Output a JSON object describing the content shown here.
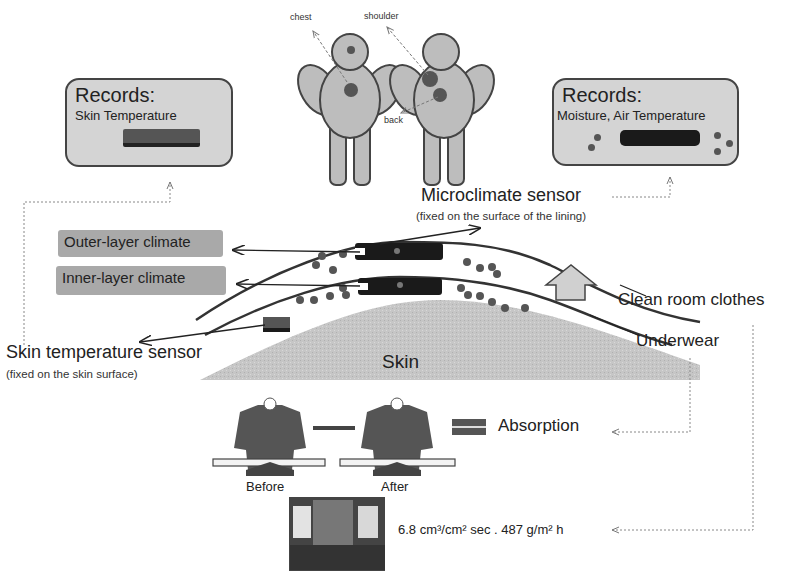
{
  "figures": {
    "body_labels": {
      "chest": "chest",
      "shoulder": "shoulder",
      "back": "back"
    }
  },
  "records_skin": {
    "title": "Records:",
    "subtitle": "Skin Temperature"
  },
  "records_micro": {
    "title": "Records:",
    "subtitle": "Moisture, Air Temperature"
  },
  "microclimate": {
    "title": "Microclimate sensor",
    "note": "(fixed on the surface of the lining)"
  },
  "layers": {
    "outer": "Outer-layer climate",
    "inner": "Inner-layer climate"
  },
  "skin_sensor": {
    "title": "Skin temperature sensor",
    "note": "(fixed on the skin surface)"
  },
  "skin_label": "Skin",
  "clothing": {
    "outer": "Clean room clothes",
    "inner": "Underwear"
  },
  "absorption": {
    "label": "Absorption",
    "before": "Before",
    "after": "After"
  },
  "permeability": {
    "value": "6.8  cm³/cm² sec . 487 g/m² h"
  },
  "colors": {
    "box_fill": "#d4d4d4",
    "label_fill": "#a9a9a9",
    "sensor": "#1a1a1a",
    "dots": "#555555",
    "skin": "#c8c8c8"
  }
}
